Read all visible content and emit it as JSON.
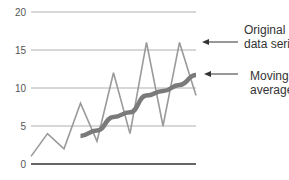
{
  "chart_data": {
    "type": "line",
    "title": "",
    "xlabel": "",
    "ylabel": "",
    "ylim": [
      0,
      20
    ],
    "yticks": [
      0,
      5,
      10,
      15,
      20
    ],
    "ytick_labels": [
      "0",
      "5",
      "10",
      "15",
      "20"
    ],
    "grid": true,
    "x": [
      1,
      2,
      3,
      4,
      5,
      6,
      7,
      8,
      9,
      10,
      11
    ],
    "series": [
      {
        "name": "Original data series",
        "x": [
          1,
          2,
          3,
          4,
          5,
          6,
          7,
          8,
          9,
          10,
          11
        ],
        "values": [
          1,
          4,
          2,
          8,
          3,
          12,
          4,
          16,
          5,
          16,
          9
        ],
        "color": "#9a9a9a"
      },
      {
        "name": "Moving average",
        "x": [
          4,
          5,
          6,
          7,
          8,
          9,
          10,
          11
        ],
        "values": [
          3.7,
          4.4,
          6.2,
          6.8,
          9.0,
          9.6,
          10.4,
          11.7
        ],
        "color": "#7a7a7a"
      }
    ],
    "annotations": [
      {
        "lines": [
          "Original",
          "data series"
        ],
        "target": "Original data series"
      },
      {
        "lines": [
          "Moving",
          "average"
        ],
        "target": "Moving average"
      }
    ],
    "legend": "right (arrow annotations)"
  }
}
